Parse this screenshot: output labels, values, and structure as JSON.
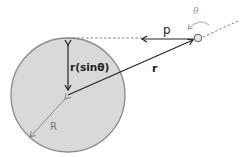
{
  "diagram": {
    "labels": {
      "momentum": "p",
      "position": "r",
      "lever_arm": "r(sinθ)",
      "radius": "R",
      "angle": "θ"
    },
    "colors": {
      "disc_fill": "#d9d9d9",
      "disc_stroke": "#8a8a8a",
      "line": "#222222",
      "dashed": "#777777",
      "radius_line": "#8a8a8a",
      "particle_fill": "#e6e6e6",
      "angle_color": "#999999"
    }
  }
}
